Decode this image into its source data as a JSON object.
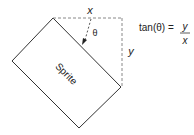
{
  "diagram": {
    "sprite_label": "Sprite",
    "x_label": "x",
    "y_label": "y",
    "theta_label": "θ",
    "formula": {
      "lhs": "tan(θ) =",
      "numerator": "y",
      "denominator": "x"
    },
    "colors": {
      "stroke": "#333333",
      "dashed": "#888888",
      "text": "#222222"
    }
  }
}
